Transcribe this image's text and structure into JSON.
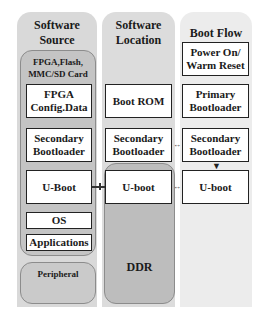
{
  "columns": [
    {
      "title": "Software Source"
    },
    {
      "title": "Software Location"
    },
    {
      "title": "Boot Flow"
    }
  ],
  "software_source": {
    "group_label": "FPGA,Flash, MMC/SD Card",
    "boxes": [
      "FPGA Config.Data",
      "Secondary Bootloader",
      "U-Boot",
      "OS",
      "Applications"
    ],
    "peripheral_label": "Peripheral"
  },
  "software_location": {
    "boxes": [
      "Boot ROM",
      "Secondary Bootloader",
      "U-boot"
    ],
    "ddr_label": "DDR"
  },
  "boot_flow": {
    "boxes": [
      "Power On/ Warm Reset",
      "Primary Bootloader",
      "Secondary Bootloader",
      "U-boot"
    ]
  },
  "colors": {
    "col_source_bg": "#d9d9d9",
    "col_location_bg": "#dcdcdc",
    "col_flow_bg": "#ececec",
    "group_bg": "#c4c4c4",
    "box_bg": "#ffffff",
    "box_border": "#222222"
  }
}
